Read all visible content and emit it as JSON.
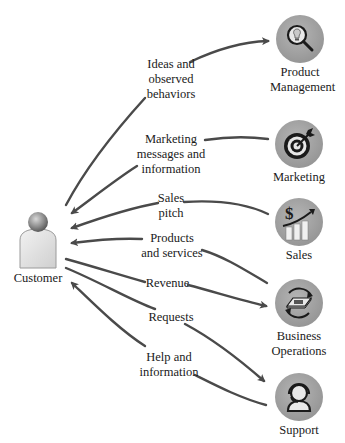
{
  "diagram": {
    "center": {
      "label": "Customer",
      "icon": "person-icon"
    },
    "nodes": [
      {
        "id": "product-management",
        "label_lines": [
          "Product",
          "Management"
        ],
        "icon": "lightbulb-magnifier-icon"
      },
      {
        "id": "marketing",
        "label_lines": [
          "Marketing"
        ],
        "icon": "target-dart-icon"
      },
      {
        "id": "sales",
        "label_lines": [
          "Sales"
        ],
        "icon": "dollar-growth-chart-icon"
      },
      {
        "id": "business-operations",
        "label_lines": [
          "Business",
          "Operations"
        ],
        "icon": "money-cycle-icon"
      },
      {
        "id": "support",
        "label_lines": [
          "Support"
        ],
        "icon": "headset-person-icon"
      }
    ],
    "flows": [
      {
        "from": "Customer",
        "to": "Product Management",
        "label_lines": [
          "Ideas and",
          "observed",
          "behaviors"
        ]
      },
      {
        "from": "Marketing",
        "to": "Customer",
        "label_lines": [
          "Marketing",
          "messages and",
          "information"
        ]
      },
      {
        "from": "Sales",
        "to": "Customer",
        "label_lines": [
          "Sales",
          "pitch"
        ]
      },
      {
        "from": "Business Operations",
        "to": "Customer",
        "label_lines": [
          "Products",
          "and services"
        ]
      },
      {
        "from": "Customer",
        "to": "Business Operations",
        "label_lines": [
          "Revenue"
        ]
      },
      {
        "from": "Customer",
        "to": "Support",
        "label_lines": [
          "Requests"
        ]
      },
      {
        "from": "Support",
        "to": "Customer",
        "label_lines": [
          "Help and",
          "information"
        ]
      }
    ]
  },
  "colors": {
    "arrow": "#4a4a4a",
    "node_fill": "#a6a6a6",
    "text": "#1a1a1a",
    "background": "#ffffff"
  }
}
